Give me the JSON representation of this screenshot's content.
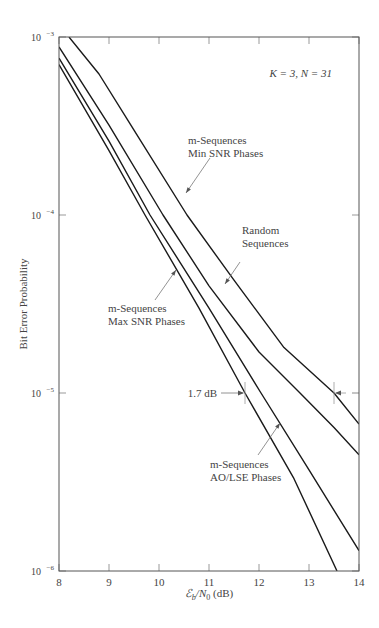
{
  "chart_data": {
    "type": "line",
    "title": "",
    "annotation_params": "K = 3, N = 31",
    "xlabel": "Eb/N0 (dB)",
    "xlabel_parts": {
      "sym": "ℰ",
      "sub": "b",
      "rest1": "/N",
      "sub2": "0",
      "rest2": " (dB)"
    },
    "ylabel": "Bit Error Probability",
    "xlim": [
      8,
      14
    ],
    "ylim": [
      1e-06,
      0.001
    ],
    "yscale": "log",
    "grid": false,
    "x_ticks": [
      "8",
      "9",
      "10",
      "11",
      "12",
      "13",
      "14"
    ],
    "y_ticks": [
      {
        "base": "10",
        "exp": "−3",
        "value": 0.001
      },
      {
        "base": "10",
        "exp": "−4",
        "value": 0.0001
      },
      {
        "base": "10",
        "exp": "−5",
        "value": 1e-05
      },
      {
        "base": "10",
        "exp": "−6",
        "value": 1e-06
      }
    ],
    "series": [
      {
        "name": "m-Sequences Min SNR Phases",
        "x": [
          8.2,
          8.8,
          9.5,
          10.56,
          11.5,
          12.5,
          13.5,
          14.0
        ],
        "y": [
          0.001,
          0.00062,
          0.0003,
          0.0001,
          4.3e-05,
          1.8e-05,
          1e-05,
          6.7e-06
        ]
      },
      {
        "name": "Random Sequences",
        "x": [
          8.0,
          9.0,
          10.08,
          11.0,
          12.0,
          12.82,
          13.5,
          14.0
        ],
        "y": [
          0.00088,
          0.00032,
          0.0001,
          4e-05,
          1.7e-05,
          1e-05,
          6.4e-06,
          4.5e-06
        ]
      },
      {
        "name": "m-Sequences Max SNR Phases",
        "x": [
          8.0,
          9.0,
          9.82,
          11.0,
          12.04,
          13.0,
          14.0
        ],
        "y": [
          0.00076,
          0.00026,
          0.0001,
          3e-05,
          1e-05,
          3.7e-06,
          1.3e-06
        ]
      },
      {
        "name": "m-Sequences AO/LSE Phases",
        "x": [
          8.0,
          9.0,
          9.72,
          10.8,
          11.72,
          12.7,
          13.56
        ],
        "y": [
          0.0007,
          0.00023,
          0.0001,
          3e-05,
          1e-05,
          3.3e-06,
          1e-06
        ]
      }
    ],
    "labels": [
      {
        "lines": [
          "m-Sequences",
          "Min SNR Phases"
        ],
        "x": 188,
        "y": 144,
        "arrow": [
          210,
          158,
          186,
          193
        ]
      },
      {
        "lines": [
          "Random",
          "Sequences"
        ],
        "x": 242,
        "y": 234,
        "arrow": [
          240,
          262,
          225,
          284
        ]
      },
      {
        "lines": [
          "m-Sequences",
          "Max SNR Phases"
        ],
        "x": 108,
        "y": 312,
        "arrow": [
          155,
          300,
          176,
          270
        ]
      },
      {
        "lines": [
          "m-Sequences",
          "AO/LSE Phases"
        ],
        "x": 210,
        "y": 468,
        "arrow": [
          258,
          455,
          280,
          423
        ]
      }
    ],
    "delta_annotation": {
      "label": "1.7 dB",
      "x_from": 11.72,
      "x_to": 13.5,
      "y": 1e-05
    }
  }
}
